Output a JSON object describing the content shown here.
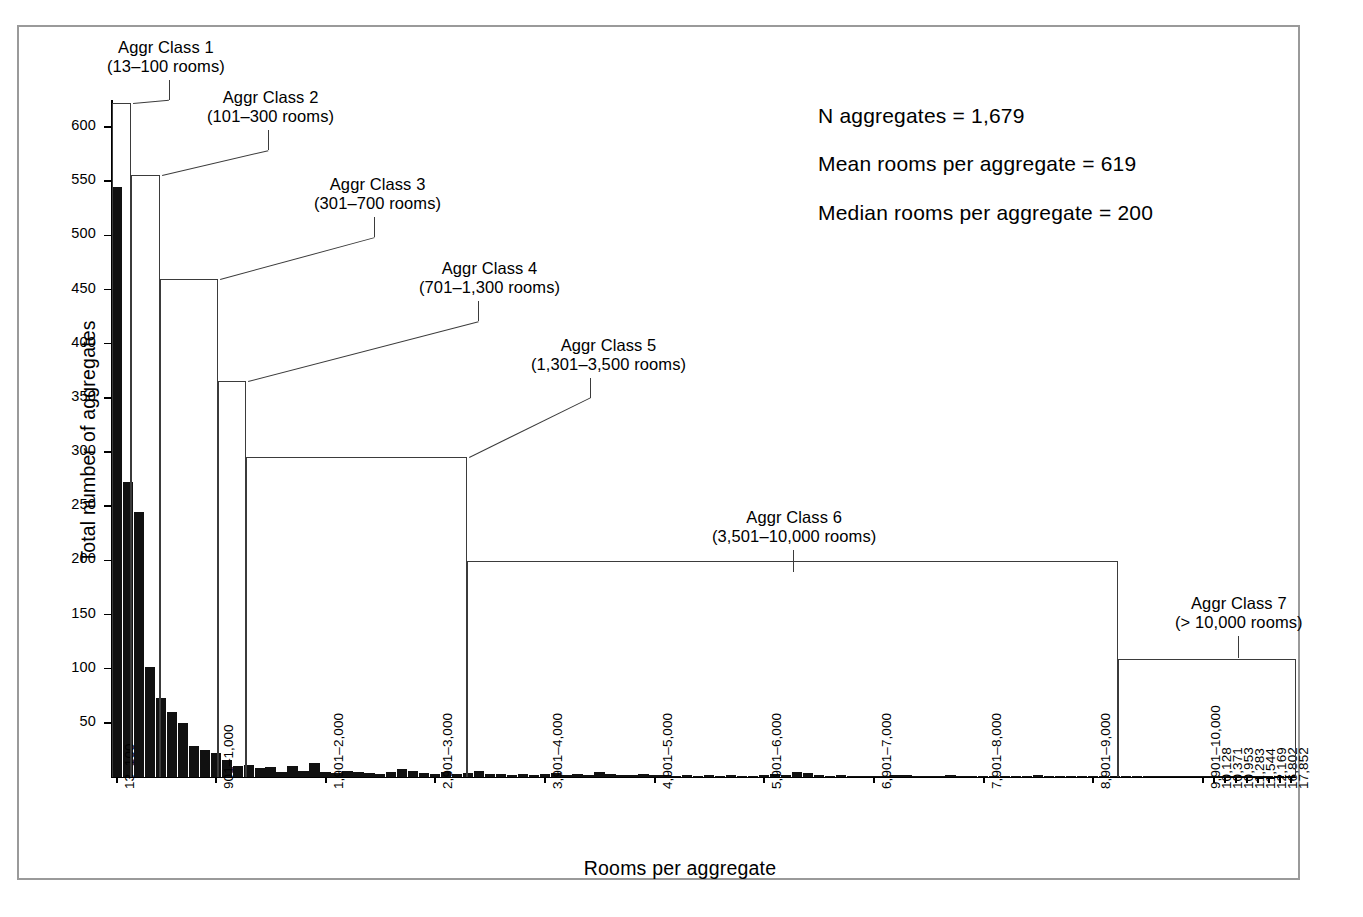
{
  "figure": {
    "border_color": "#9a9a9a",
    "bar_color": "#111111",
    "box_color": "#3b3b3b"
  },
  "axes": {
    "ylabel": "Total number of aggregates",
    "xlabel": "Rooms per aggregate",
    "yticks": [
      50,
      100,
      150,
      200,
      250,
      300,
      350,
      400,
      450,
      500,
      550,
      600
    ],
    "ytick_labels": [
      "50",
      "100",
      "150",
      "200",
      "250",
      "300",
      "350",
      "400",
      "450",
      "500",
      "550",
      "600"
    ],
    "ylim": [
      0,
      625
    ]
  },
  "stats": {
    "n_aggregates": "N aggregates = 1,679",
    "mean_rooms": "Mean rooms per aggregate = 619",
    "median_rooms": "Median rooms per aggregate = 200"
  },
  "classes": [
    {
      "name": "Aggr Class 1",
      "range": "(13–100 rooms)",
      "value": 622
    },
    {
      "name": "Aggr Class 2",
      "range": "(101–300 rooms)",
      "value": 556
    },
    {
      "name": "Aggr Class 3",
      "range": "(301–700 rooms)",
      "value": 460
    },
    {
      "name": "Aggr Class 4",
      "range": "(701–1,300 rooms)",
      "value": 366
    },
    {
      "name": "Aggr Class 5",
      "range": "(1,301–3,500 rooms)",
      "value": 295
    },
    {
      "name": "Aggr Class 6",
      "range": "(3,501–10,000 rooms)",
      "value": 199
    },
    {
      "name": "Aggr Class 7",
      "range": "(> 10,000 rooms)",
      "value": 109
    }
  ],
  "xtick_labels": [
    "13–100",
    "901–1,000",
    "1,901–2,000",
    "2,901–3,000",
    "3,901–4,000",
    "4,901–5,000",
    "5,901–6,000",
    "6,901–7,000",
    "7,901–8,000",
    "8,901–9,000",
    "9,901–10,000",
    "10,128",
    "10,371",
    "10,953",
    "11,283",
    "11,544",
    "12,169",
    "16,802",
    "17,852"
  ],
  "chart_data": {
    "type": "bar",
    "title": "",
    "xlabel": "Rooms per aggregate",
    "ylabel": "Total number of aggregates",
    "ylim": [
      0,
      625
    ],
    "grid": false,
    "legend": null,
    "categories": [
      "13–100",
      "101–200",
      "201–300",
      "301–400",
      "401–500",
      "501–600",
      "601–700",
      "701–800",
      "801–900",
      "901–1,000",
      "1,001–1,100",
      "1,101–1,200",
      "1,201–1,300",
      "1,301–1,400",
      "1,401–1,500",
      "1,501–1,600",
      "1,601–1,700",
      "1,701–1,800",
      "1,801–1,900",
      "1,901–2,000",
      "2,001–2,100",
      "2,101–2,200",
      "2,201–2,300",
      "2,301–2,400",
      "2,401–2,500",
      "2,501–2,600",
      "2,601–2,700",
      "2,701–2,800",
      "2,801–2,900",
      "2,901–3,000",
      "3,001–3,100",
      "3,101–3,200",
      "3,201–3,300",
      "3,301–3,400",
      "3,401–3,500",
      "3,501–3,600",
      "3,601–3,700",
      "3,701–3,800",
      "3,801–3,900",
      "3,901–4,000",
      "4,001–4,100",
      "4,101–4,200",
      "4,201–4,300",
      "4,301–4,400",
      "4,401–4,500",
      "4,501–4,600",
      "4,601–4,700",
      "4,701–4,800",
      "4,801–4,900",
      "4,901–5,000",
      "5,001–5,100",
      "5,101–5,200",
      "5,201–5,300",
      "5,301–5,400",
      "5,401–5,500",
      "5,501–5,600",
      "5,601–5,700",
      "5,701–5,800",
      "5,801–5,900",
      "5,901–6,000",
      "6,001–6,100",
      "6,101–6,200",
      "6,201–6,300",
      "6,301–6,400",
      "6,401–6,500",
      "6,501–6,600",
      "6,601–6,700",
      "6,701–6,800",
      "6,801–6,900",
      "6,901–7,000",
      "7,001–7,100",
      "7,101–7,200",
      "7,201–7,300",
      "7,301–7,400",
      "7,401–7,500",
      "7,501–7,600",
      "7,601–7,700",
      "7,701–7,800",
      "7,801–7,900",
      "7,901–8,000",
      "8,001–8,100",
      "8,101–8,200",
      "8,201–8,300",
      "8,301–8,400",
      "8,401–8,500",
      "8,501–8,600",
      "8,601–8,700",
      "8,701–8,800",
      "8,801–8,900",
      "8,901–9,000",
      "9,001–9,100",
      "9,101–9,200",
      "9,201–9,300",
      "9,301–9,400",
      "9,401–9,500",
      "9,501–9,600",
      "9,601–9,700",
      "9,701–9,800",
      "9,801–9,900",
      "9,901–10,000",
      "10,128",
      "10,371",
      "10,953",
      "11,283",
      "11,544",
      "12,169",
      "16,802",
      "17,852"
    ],
    "values": [
      545,
      272,
      245,
      102,
      73,
      60,
      50,
      29,
      25,
      22,
      16,
      10,
      11,
      8,
      9,
      5,
      10,
      6,
      13,
      5,
      4,
      6,
      5,
      4,
      3,
      5,
      7,
      6,
      4,
      3,
      5,
      3,
      4,
      6,
      3,
      3,
      2,
      3,
      2,
      3,
      4,
      2,
      3,
      2,
      5,
      3,
      2,
      2,
      3,
      2,
      2,
      1,
      2,
      1,
      2,
      1,
      2,
      1,
      1,
      2,
      3,
      2,
      5,
      4,
      2,
      1,
      2,
      1,
      1,
      1,
      1,
      2,
      2,
      1,
      1,
      1,
      2,
      1,
      1,
      1,
      1,
      1,
      1,
      1,
      2,
      1,
      1,
      1,
      1,
      1,
      1,
      1,
      1,
      1,
      1,
      1,
      1,
      1,
      1,
      1,
      1,
      1,
      1,
      1,
      1,
      1,
      1,
      1
    ],
    "class_rectangles": {
      "names": [
        "Aggr Class 1",
        "Aggr Class 2",
        "Aggr Class 3",
        "Aggr Class 4",
        "Aggr Class 5",
        "Aggr Class 6",
        "Aggr Class 7"
      ],
      "ranges": [
        "13–100 rooms",
        "101–300 rooms",
        "301–700 rooms",
        "701–1,300 rooms",
        "1,301–3,500 rooms",
        "3,501–10,000 rooms",
        "> 10,000 rooms"
      ],
      "heights": [
        622,
        556,
        460,
        366,
        295,
        199,
        109
      ]
    }
  }
}
